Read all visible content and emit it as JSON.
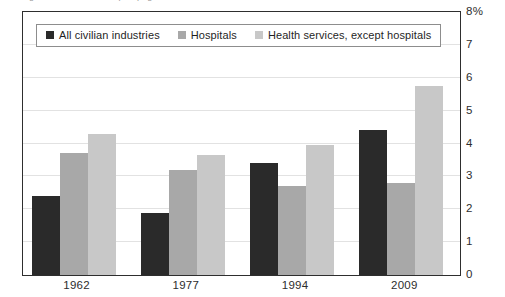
{
  "clipped_caption": "figure data cut off at top of page",
  "legend": {
    "entries": [
      {
        "label": "All civilian industries",
        "color": "#2a2a2a",
        "swatch_name": "legend-swatch-all-civilian-industries"
      },
      {
        "label": "Hospitals",
        "color": "#a8a8a8",
        "swatch_name": "legend-swatch-hospitals"
      },
      {
        "label": "Health services, except hospitals",
        "color": "#c8c8c8",
        "swatch_name": "legend-swatch-health-services"
      }
    ]
  },
  "chart_data": {
    "type": "bar",
    "title": "",
    "subtitle": "",
    "xlabel": "",
    "ylabel": "",
    "categories": [
      "1962",
      "1977",
      "1994",
      "2009"
    ],
    "series": [
      {
        "name": "All civilian industries",
        "color": "#2a2a2a",
        "values": [
          2.4,
          1.9,
          3.4,
          4.4
        ]
      },
      {
        "name": "Hospitals",
        "color": "#a8a8a8",
        "values": [
          3.7,
          3.2,
          2.7,
          2.8
        ]
      },
      {
        "name": "Health services, except hospitals",
        "color": "#c8c8c8",
        "values": [
          4.3,
          3.65,
          3.95,
          5.75
        ]
      }
    ],
    "ylim": [
      0,
      8
    ],
    "yticks": [
      0,
      1,
      2,
      3,
      4,
      5,
      6,
      7,
      8
    ],
    "ytick_labels": [
      "0",
      "1",
      "2",
      "3",
      "4",
      "5",
      "6",
      "7",
      "8%"
    ],
    "y_unit": "%",
    "grid": true,
    "legend_position": "top-left-inside"
  }
}
